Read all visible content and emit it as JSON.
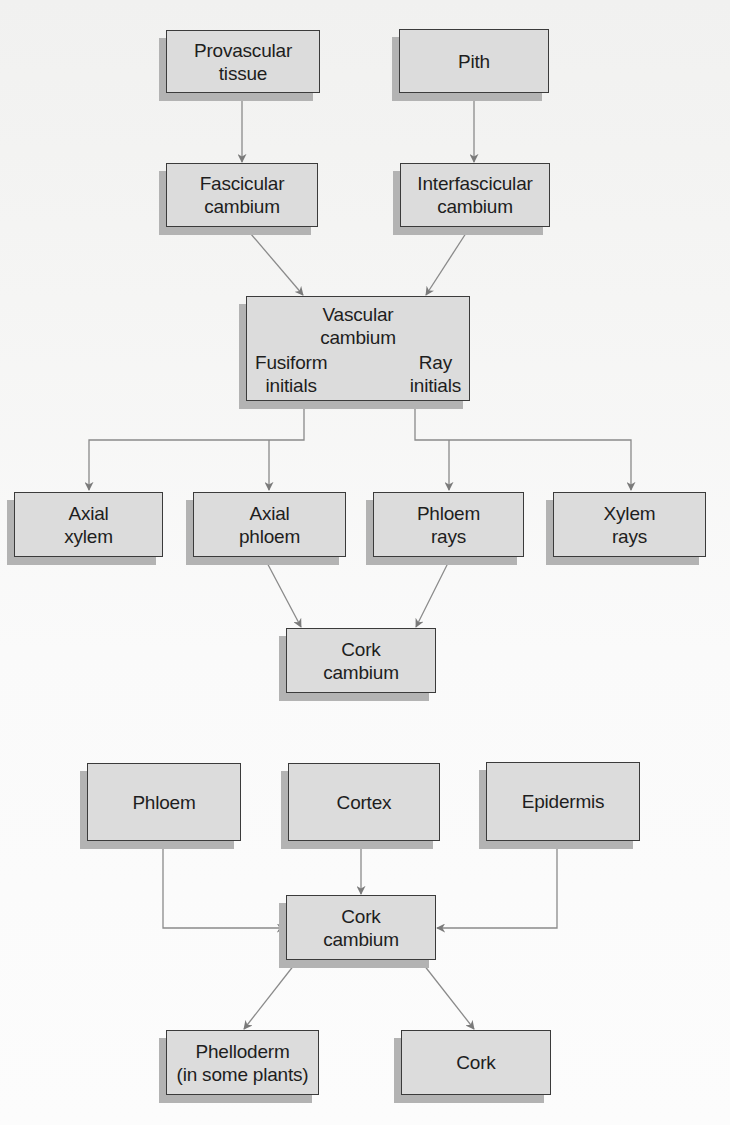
{
  "diagram": {
    "colors": {
      "box_fill": "#dcdcdc",
      "box_border": "#3b3b3b",
      "box_shadow": "#b3b3b3",
      "arrow": "#7a7a7a",
      "background": "#f7f7f6"
    },
    "nodes": {
      "provascular": {
        "line1": "Provascular",
        "line2": "tissue"
      },
      "pith": {
        "line1": "Pith"
      },
      "fascicular": {
        "line1": "Fascicular",
        "line2": "cambium"
      },
      "interfascicular": {
        "line1": "Interfascicular",
        "line2": "cambium"
      },
      "vascular": {
        "line1": "Vascular",
        "line2": "cambium",
        "left": {
          "line1": "Fusiform",
          "line2": "initials"
        },
        "right": {
          "line1": "Ray",
          "line2": "initials"
        }
      },
      "axial_xylem": {
        "line1": "Axial",
        "line2": "xylem"
      },
      "axial_phloem": {
        "line1": "Axial",
        "line2": "phloem"
      },
      "phloem_rays": {
        "line1": "Phloem",
        "line2": "rays"
      },
      "xylem_rays": {
        "line1": "Xylem",
        "line2": "rays"
      },
      "cork_cambium_1": {
        "line1": "Cork",
        "line2": "cambium"
      },
      "phloem": {
        "line1": "Phloem"
      },
      "cortex": {
        "line1": "Cortex"
      },
      "epidermis": {
        "line1": "Epidermis"
      },
      "cork_cambium_2": {
        "line1": "Cork",
        "line2": "cambium"
      },
      "phelloderm": {
        "line1": "Phelloderm",
        "line2": "(in some plants)"
      },
      "cork": {
        "line1": "Cork"
      }
    },
    "edges": [
      {
        "from": "Provascular tissue",
        "to": "Fascicular cambium"
      },
      {
        "from": "Pith",
        "to": "Interfascicular cambium"
      },
      {
        "from": "Fascicular cambium",
        "to": "Vascular cambium"
      },
      {
        "from": "Interfascicular cambium",
        "to": "Vascular cambium"
      },
      {
        "from": "Fusiform initials",
        "to": "Axial xylem"
      },
      {
        "from": "Fusiform initials",
        "to": "Axial phloem"
      },
      {
        "from": "Ray initials",
        "to": "Phloem rays"
      },
      {
        "from": "Ray initials",
        "to": "Xylem rays"
      },
      {
        "from": "Axial phloem",
        "to": "Cork cambium"
      },
      {
        "from": "Phloem rays",
        "to": "Cork cambium"
      },
      {
        "from": "Phloem",
        "to": "Cork cambium"
      },
      {
        "from": "Cortex",
        "to": "Cork cambium"
      },
      {
        "from": "Epidermis",
        "to": "Cork cambium"
      },
      {
        "from": "Cork cambium",
        "to": "Phelloderm (in some plants)"
      },
      {
        "from": "Cork cambium",
        "to": "Cork"
      }
    ]
  }
}
